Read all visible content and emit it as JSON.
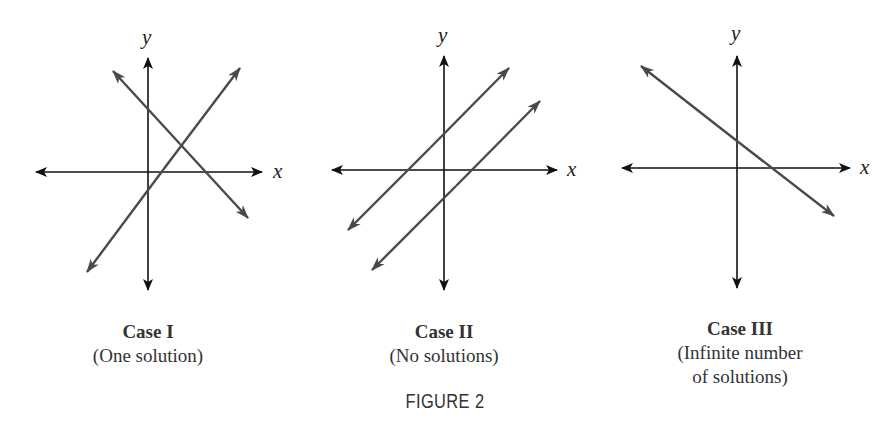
{
  "figure": {
    "label": "FIGURE 2",
    "panels": [
      {
        "id": "case-1",
        "title": "Case I",
        "subtitle_lines": [
          "(One solution)"
        ],
        "x_axis_label": "x",
        "y_axis_label": "y",
        "description": "Two intersecting lines"
      },
      {
        "id": "case-2",
        "title": "Case II",
        "subtitle_lines": [
          "(No solutions)"
        ],
        "x_axis_label": "x",
        "y_axis_label": "y",
        "description": "Two parallel lines"
      },
      {
        "id": "case-3",
        "title": "Case III",
        "subtitle_lines": [
          "(Infinite number",
          "of solutions)"
        ],
        "x_axis_label": "x",
        "y_axis_label": "y",
        "description": "Two coincident lines (single visible line)"
      }
    ]
  },
  "colors": {
    "axis": "#111111",
    "line": "#4a4a4a",
    "text": "#333333",
    "background": "#ffffff"
  }
}
